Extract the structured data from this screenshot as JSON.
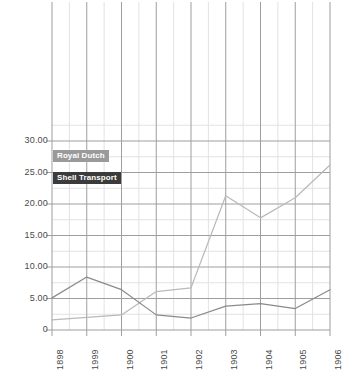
{
  "chart_data": {
    "type": "line",
    "title": "",
    "xlabel": "",
    "ylabel": "",
    "x": [
      "1898",
      "1999",
      "1900",
      "1901",
      "1902",
      "1903",
      "1904",
      "1905",
      "1906"
    ],
    "categories": [
      "1898",
      "1999",
      "1900",
      "1901",
      "1902",
      "1903",
      "1904",
      "1905",
      "1906"
    ],
    "series": [
      {
        "name": "Royal Dutch",
        "color": "#b9b9b9",
        "values": [
          1.6,
          2.0,
          2.4,
          6.1,
          6.7,
          21.3,
          17.8,
          21.0,
          26.2
        ]
      },
      {
        "name": "Shell Transport",
        "color": "#8a8a8a",
        "values": [
          5.1,
          8.4,
          6.4,
          2.4,
          1.9,
          3.8,
          4.2,
          3.4,
          6.4
        ]
      }
    ],
    "ylim": [
      0,
      35
    ],
    "yticks": [
      "0",
      "5.00",
      "10.00",
      "15.00",
      "20.00",
      "25.00",
      "30.00"
    ],
    "ytick_values": [
      0,
      5,
      10,
      15,
      20,
      25,
      30
    ],
    "grid": true,
    "minor_grid": true,
    "legend_position": "inside-top-left"
  },
  "legend": {
    "royal_dutch": "Royal Dutch",
    "shell_transport": "Shell Transport"
  },
  "colors": {
    "royal_dutch_line": "#b9b9b9",
    "shell_transport_line": "#8a8a8a",
    "royal_dutch_badge": "#9a9a9a",
    "shell_transport_badge": "#3b3b3b",
    "major_grid": "#9e9e9e",
    "minor_grid": "#e2e2e2",
    "tick_text": "#4a4a4a",
    "background": "#ffffff"
  }
}
